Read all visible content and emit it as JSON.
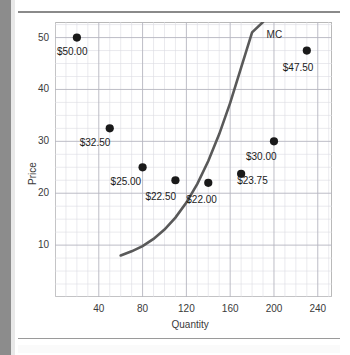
{
  "chart_data": {
    "type": "scatter",
    "title": "",
    "xlabel": "Quantity",
    "ylabel": "Price",
    "xlim": [
      0,
      253
    ],
    "ylim": [
      0,
      53
    ],
    "grid": true,
    "legend": "none",
    "x_ticks": [
      40,
      80,
      120,
      160,
      200,
      240
    ],
    "y_ticks": [
      10,
      20,
      30,
      40,
      50
    ],
    "x_tick_labels": [
      "40",
      "80",
      "120",
      "160",
      "200",
      "240"
    ],
    "y_tick_labels": [
      "10",
      "20",
      "30",
      "40",
      "50"
    ],
    "series": [
      {
        "name": "Price points",
        "type": "scatter",
        "marker": "filled-circle",
        "color": "#1a1a1a",
        "points": [
          {
            "x": 20,
            "y": 50.0,
            "label": "$50.00"
          },
          {
            "x": 50,
            "y": 32.5,
            "label": "$32.50"
          },
          {
            "x": 80,
            "y": 25.0,
            "label": "$25.00"
          },
          {
            "x": 110,
            "y": 22.5,
            "label": "$22.50"
          },
          {
            "x": 140,
            "y": 22.0,
            "label": "$22.00"
          },
          {
            "x": 170,
            "y": 23.75,
            "label": "$23.75"
          },
          {
            "x": 200,
            "y": 30.0,
            "label": "$30.00"
          },
          {
            "x": 230,
            "y": 47.5,
            "label": "$47.50"
          }
        ]
      },
      {
        "name": "MC",
        "type": "line",
        "color": "#595959",
        "annotation": "MC",
        "x": [
          60,
          70,
          80,
          90,
          100,
          110,
          120,
          130,
          140,
          150,
          160,
          170,
          180,
          190
        ],
        "y": [
          8.0,
          8.8,
          9.8,
          11.2,
          13.0,
          15.3,
          18.2,
          21.8,
          26.2,
          31.4,
          37.4,
          44.2,
          51.0,
          53.0
        ]
      }
    ],
    "annotations": [
      {
        "text": "MC",
        "x": 196,
        "y": 50.5
      }
    ]
  }
}
